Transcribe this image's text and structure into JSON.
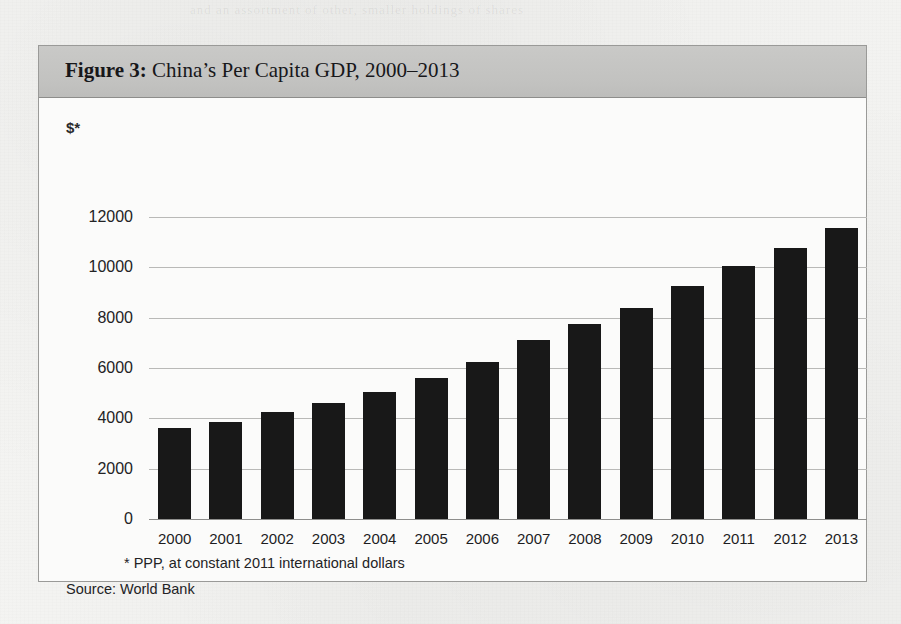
{
  "figure": {
    "label": "Figure 3:",
    "title": " China’s Per Capita GDP, 2000–2013",
    "unit_label": "$*",
    "footnote": "* PPP, at constant 2011 international dollars",
    "source": "Source: World Bank"
  },
  "bleed_through": [
    "and an assortment of other, smaller holdings of shares",
    "the rest of the stock market capitalisation and the",
    "company. At the end of 1997, it held 46",
    "percent of the market. The discrepancy, said  a  report",
    "the Commission and the standards began to change",
    "the world as a basis for judging stakes in those",
    "RMB  and",
    "WHAT’S THE CRISIS?"
  ],
  "chart_data": {
    "type": "bar",
    "title": "Figure 3: China’s Per Capita GDP, 2000–2013",
    "xlabel": "",
    "ylabel": "$*",
    "ylim": [
      0,
      12800
    ],
    "grid": true,
    "legend": "none",
    "categories": [
      "2000",
      "2001",
      "2002",
      "2003",
      "2004",
      "2005",
      "2006",
      "2007",
      "2008",
      "2009",
      "2010",
      "2011",
      "2012",
      "2013"
    ],
    "values": [
      3600,
      3850,
      4250,
      4600,
      5050,
      5600,
      6250,
      7100,
      7750,
      8400,
      9250,
      10050,
      10750,
      11550
    ],
    "yticks": [
      0,
      2000,
      4000,
      6000,
      8000,
      10000,
      12000
    ],
    "ytick_labels": [
      "0",
      "2000",
      "4000",
      "6000",
      "8000",
      "10000",
      "12000"
    ],
    "bar_color": "#181818",
    "note": "* PPP, at constant 2011 international dollars",
    "source": "Source: World Bank"
  }
}
